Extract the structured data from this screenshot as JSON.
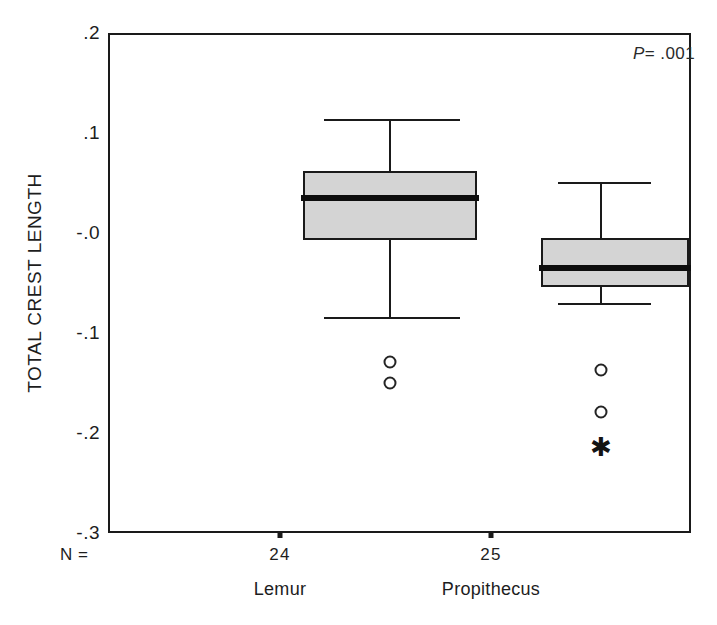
{
  "chart_data": {
    "type": "box",
    "title": "",
    "xlabel": "",
    "ylabel": "TOTAL CREST LENGTH",
    "ylim": [
      -0.3,
      0.2
    ],
    "yticks": [
      0.2,
      0.1,
      -0.0,
      -0.1,
      -0.2,
      -0.3
    ],
    "ytick_labels": [
      ".2",
      ".1",
      "-.0",
      "-.1",
      "-.2",
      "-.3"
    ],
    "grid": false,
    "legend": "none",
    "annotations": [
      {
        "name": "p-value",
        "text_prefix": "P",
        "text_suffix": "= .001",
        "full_text": "P= .001"
      }
    ],
    "n_label": "N =",
    "categories": [
      "Lemur",
      "Propithecus"
    ],
    "groups": [
      {
        "name": "Lemur",
        "n": "24",
        "whisker_high": 0.148,
        "q3": 0.097,
        "median": 0.07,
        "q1": 0.028,
        "whisker_low": -0.05,
        "outliers": [
          {
            "value": -0.094,
            "marker": "circle"
          },
          {
            "value": -0.115,
            "marker": "circle"
          }
        ]
      },
      {
        "name": "Propithecus",
        "n": "25",
        "whisker_high": 0.085,
        "q3": 0.03,
        "median": 0.0,
        "q1": -0.019,
        "whisker_low": -0.036,
        "outliers": [
          {
            "value": -0.102,
            "marker": "circle"
          },
          {
            "value": -0.144,
            "marker": "circle"
          },
          {
            "value": -0.179,
            "marker": "asterisk"
          }
        ]
      }
    ],
    "colors": {
      "box_fill": "#d4d4d4",
      "line": "#1a1a1a",
      "median": "#0d0d0d",
      "background": "#ffffff"
    }
  },
  "axis": {
    "y_title": "TOTAL CREST LENGTH",
    "tick_labels": [
      ".2",
      ".1",
      "-.0",
      "-.1",
      "-.2",
      "-.3"
    ]
  },
  "footer": {
    "n_label": "N =",
    "n_values": [
      "24",
      "25"
    ],
    "group_names": [
      "Lemur",
      "Propithecus"
    ]
  },
  "annotation": {
    "p_symbol": "P",
    "p_rest": "= .001"
  },
  "markers": {
    "asterisk_glyph": "✱"
  }
}
